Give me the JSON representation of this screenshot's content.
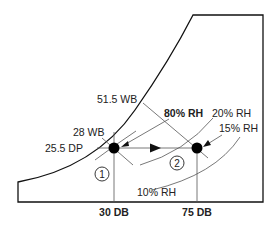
{
  "diagram": {
    "type": "psychrometric-chart-process",
    "labels": {
      "wb_high": "51.5 WB",
      "rh_80": "80% RH",
      "rh_20": "20% RH",
      "rh_15": "15% RH",
      "rh_10": "10% RH",
      "wb_low": "28 WB",
      "dp": "25.5 DP",
      "db_1": "30 DB",
      "db_2": "75 DB"
    },
    "points": [
      {
        "id": "1",
        "label": "1",
        "db": "30 DB",
        "wb": "28 WB",
        "dp": "25.5 DP",
        "rh": "80% RH"
      },
      {
        "id": "2",
        "label": "2",
        "db": "75 DB",
        "wb": "51.5 WB",
        "rh": "15% RH"
      }
    ],
    "process": "Sensible heating from state 1 to state 2 at constant dew point (arrow left to right)",
    "colors": {
      "line": "#555555",
      "frame": "#111111",
      "point": "#000000"
    }
  }
}
